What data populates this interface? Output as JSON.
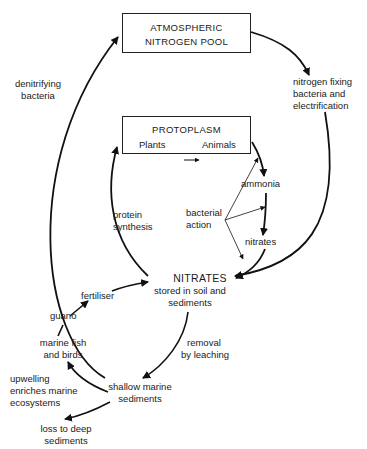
{
  "diagram": {
    "nodes": {
      "atmospheric": {
        "line1": "ATMOSPHERIC",
        "line2": "NITROGEN POOL"
      },
      "protoplasm": {
        "title": "PROTOPLASM",
        "plants": "Plants",
        "animals": "Animals"
      },
      "nitrates": {
        "title": "NITRATES",
        "line1": "stored in soil and",
        "line2": "sediments"
      },
      "ammonia": "ammonia",
      "nitrates_small": "nitrates",
      "shallow": {
        "line1": "shallow marine",
        "line2": "sediments"
      },
      "fish": {
        "line1": "marine fish",
        "line2": "and birds"
      },
      "guano": "guano",
      "fertiliser": "fertiliser",
      "deep": {
        "line1": "loss to deep",
        "line2": "sediments"
      }
    },
    "labels": {
      "denitrifying": {
        "line1": "denitrifying",
        "line2": "bacteria"
      },
      "fixing": {
        "line1": "nitrogen fixing",
        "line2": "bacteria and",
        "line3": "electrification"
      },
      "protein": {
        "line1": "protein",
        "line2": "synthesis"
      },
      "bacterial": {
        "line1": "bacterial",
        "line2": "action"
      },
      "leaching": {
        "line1": "removal",
        "line2": "by leaching"
      },
      "upwelling": {
        "line1": "upwelling",
        "line2": "enriches marine",
        "line3": "ecosystems"
      }
    }
  }
}
